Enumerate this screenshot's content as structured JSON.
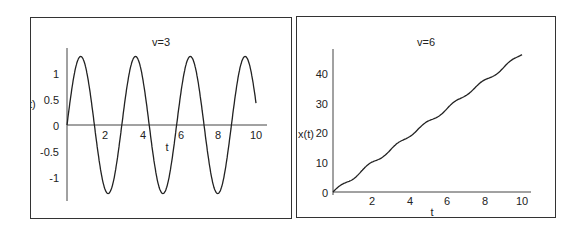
{
  "chart_data": [
    {
      "type": "line",
      "title": "v=3",
      "xlabel": "t",
      "ylabel": "x(t)",
      "ylabel_visible": "t)",
      "xlim": [
        0,
        10
      ],
      "ylim": [
        -1.35,
        1.35
      ],
      "x_ticks": [
        "2",
        "4",
        "6",
        "8",
        "10"
      ],
      "y_ticks": [
        "1",
        "0.5",
        "0",
        "-0.5",
        "-1"
      ],
      "grid": false,
      "description": "oscillation x(t) ≈ 1.32·sin(2πt/2.9)",
      "x": [
        0,
        0.7,
        1.45,
        2.2,
        2.9,
        3.6,
        4.35,
        5.1,
        5.8,
        6.5,
        7.25,
        8.0,
        8.7,
        9.4,
        10
      ],
      "values": [
        0,
        1.32,
        0,
        -1.32,
        0,
        1.32,
        0,
        -1.32,
        0,
        1.32,
        0,
        -1.32,
        0,
        1.32,
        0.3
      ]
    },
    {
      "type": "line",
      "title": "v=6",
      "xlabel": "t",
      "ylabel": "x(t)",
      "xlim": [
        0,
        10
      ],
      "ylim": [
        0,
        48
      ],
      "x_ticks": [
        "2",
        "4",
        "6",
        "8",
        "10"
      ],
      "y_ticks": [
        "0",
        "10",
        "20",
        "30",
        "40"
      ],
      "grid": false,
      "description": "nearly linear growth with small wiggles, x(t) ≈ 4.7·t",
      "x": [
        0,
        1,
        2,
        3,
        4,
        5,
        6,
        7,
        8,
        9,
        10
      ],
      "values": [
        0,
        4.5,
        9.5,
        14,
        19,
        23.5,
        28,
        33,
        37.5,
        42,
        47
      ]
    }
  ],
  "left": {
    "title": "v=3",
    "xlabel": "t",
    "ylabel": "t)",
    "x_ticks": [
      "2",
      "4",
      "6",
      "8",
      "10"
    ],
    "y_ticks": [
      "1",
      "0.5",
      "0",
      "-0.5",
      "-1"
    ]
  },
  "right": {
    "title": "v=6",
    "xlabel": "t",
    "ylabel": "x(t)",
    "x_ticks": [
      "2",
      "4",
      "6",
      "8",
      "10"
    ],
    "y_ticks": [
      "0",
      "10",
      "20",
      "30",
      "40"
    ]
  }
}
